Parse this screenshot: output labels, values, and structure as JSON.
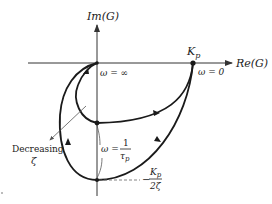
{
  "diagram": {
    "type": "nyquist-plot",
    "axes": {
      "imag_label": "Im(G)",
      "real_label": "Re(G)"
    },
    "points": {
      "kp_label": "Kp",
      "kp_sub": "p",
      "kp_main": "K",
      "omega_zero": "ω = 0",
      "omega_inf": "ω = ∞",
      "omega_tau_prefix": "ω =",
      "omega_tau_num": "1",
      "omega_tau_den": "τ",
      "omega_tau_den_sub": "p",
      "min_imag_prefix": "−",
      "min_imag_num": "K",
      "min_imag_num_sub": "p",
      "min_imag_den": "2ζ"
    },
    "annotation": {
      "line1": "Decreasing",
      "line2": "ζ"
    },
    "colors": {
      "curve": "#1a1a1a",
      "axis": "#333333",
      "annotation": "#555555",
      "background": "#ffffff"
    }
  }
}
